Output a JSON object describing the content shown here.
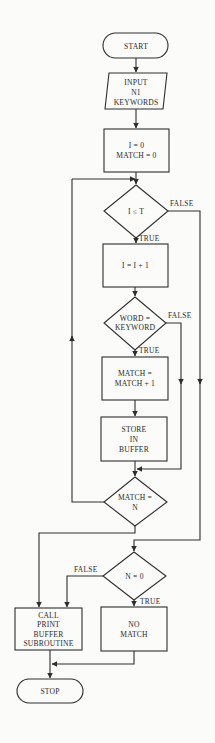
{
  "colors": {
    "background": "#fbfbf9",
    "stroke": "#2e2e2e",
    "text": "#2a2a2a"
  },
  "nodes": {
    "start": {
      "type": "terminator",
      "lines": [
        "START"
      ]
    },
    "input": {
      "type": "io",
      "lines": [
        "INPUT",
        "N1",
        "KEYWORDS"
      ]
    },
    "init": {
      "type": "process",
      "lines": [
        "I = 0",
        "MATCH = 0"
      ]
    },
    "cond_i": {
      "type": "decision",
      "lines": [
        "I ≤ T"
      ]
    },
    "incr": {
      "type": "process",
      "lines": [
        "I = I + 1"
      ]
    },
    "cond_word": {
      "type": "decision",
      "lines": [
        "WORD =",
        "KEYWORD"
      ]
    },
    "match_incr": {
      "type": "process",
      "lines": [
        "MATCH =",
        "MATCH + 1"
      ]
    },
    "store": {
      "type": "process",
      "lines": [
        "STORE",
        "IN",
        "BUFFER"
      ]
    },
    "cond_match": {
      "type": "decision",
      "lines": [
        "MATCH =",
        "N"
      ]
    },
    "cond_n": {
      "type": "decision",
      "lines": [
        "N = 0"
      ]
    },
    "call_print": {
      "type": "process",
      "lines": [
        "CALL",
        "PRINT",
        "BUFFER",
        "SUBROUTINE"
      ]
    },
    "no_match": {
      "type": "process",
      "lines": [
        "NO",
        "MATCH"
      ]
    },
    "stop": {
      "type": "terminator",
      "lines": [
        "STOP"
      ]
    }
  },
  "edge_labels": {
    "cond_i_false": "FALSE",
    "cond_i_true": "TRUE",
    "cond_word_false": "FALSE",
    "cond_word_true": "TRUE",
    "cond_n_false": "FALSE",
    "cond_n_true": "TRUE"
  }
}
